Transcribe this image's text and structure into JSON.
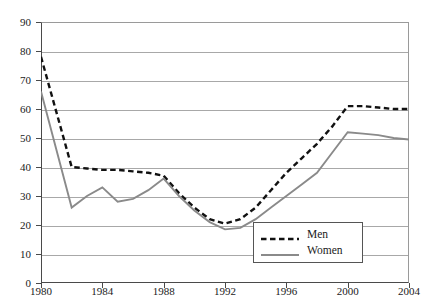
{
  "figure": {
    "caption_sliver": " "
  },
  "legend": {
    "position": "inside-bottom-right",
    "entries": [
      {
        "label": "Men",
        "style": "dashed",
        "color": "#111111"
      },
      {
        "label": "Women",
        "style": "solid",
        "color": "#8a8a8a"
      }
    ]
  },
  "chart_data": {
    "type": "line",
    "title": "",
    "subtitle": "",
    "xlabel": "",
    "ylabel": "",
    "xlim": [
      1980,
      2004
    ],
    "ylim": [
      0,
      90
    ],
    "grid": true,
    "y_ticks": [
      0,
      10,
      20,
      30,
      40,
      50,
      60,
      70,
      80,
      90
    ],
    "x_ticks": [
      1980,
      1984,
      1988,
      1992,
      1996,
      2000,
      2004
    ],
    "x_tick_labels": [
      "1980",
      "1984",
      "1988",
      "1992",
      "1996",
      "2000",
      "2004"
    ],
    "y_tick_labels": [
      "0",
      "10",
      "20",
      "30",
      "40",
      "50",
      "60",
      "70",
      "80",
      "90"
    ],
    "x": [
      1980,
      1981,
      1982,
      1983,
      1984,
      1985,
      1986,
      1987,
      1988,
      1989,
      1990,
      1991,
      1992,
      1993,
      1994,
      1995,
      1996,
      1997,
      1998,
      1999,
      2000,
      2001,
      2002,
      2003,
      2004
    ],
    "series": [
      {
        "name": "Men",
        "color": "#111111",
        "style": "dashed",
        "values": [
          78,
          59,
          40,
          39.5,
          39,
          39,
          38.5,
          38,
          37,
          31,
          26,
          22,
          20.5,
          22,
          26,
          32,
          38,
          43,
          48,
          54,
          61,
          61,
          60.5,
          60,
          60
        ]
      },
      {
        "name": "Women",
        "color": "#8a8a8a",
        "style": "solid",
        "values": [
          66,
          46,
          26,
          30,
          33,
          28,
          29,
          32,
          36,
          30,
          25,
          21,
          18.5,
          19,
          22,
          26,
          30,
          34,
          38,
          45,
          52,
          51.5,
          51,
          50,
          49.5
        ]
      }
    ]
  }
}
